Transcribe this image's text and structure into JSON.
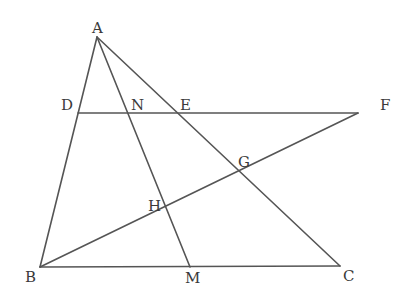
{
  "diagram": {
    "type": "geometry-figure",
    "line_color": "#555555",
    "points": {
      "A": {
        "label": "A",
        "x": 97,
        "y": 37
      },
      "B": {
        "label": "B",
        "x": 40,
        "y": 267
      },
      "C": {
        "label": "C",
        "x": 340,
        "y": 266
      },
      "D": {
        "label": "D",
        "x": 78,
        "y": 113
      },
      "E": {
        "label": "E",
        "x": 175,
        "y": 113
      },
      "F": {
        "label": "F",
        "x": 358,
        "y": 113
      },
      "G": {
        "label": "G",
        "x": 243,
        "y": 176
      },
      "H": {
        "label": "H",
        "x": 165,
        "y": 209
      },
      "M": {
        "label": "M",
        "x": 190,
        "y": 267
      },
      "N": {
        "label": "N",
        "x": 128,
        "y": 113
      }
    },
    "segments": [
      [
        "A",
        "B"
      ],
      [
        "A",
        "C"
      ],
      [
        "B",
        "C"
      ],
      [
        "A",
        "M"
      ],
      [
        "D",
        "F"
      ],
      [
        "B",
        "F"
      ]
    ]
  }
}
